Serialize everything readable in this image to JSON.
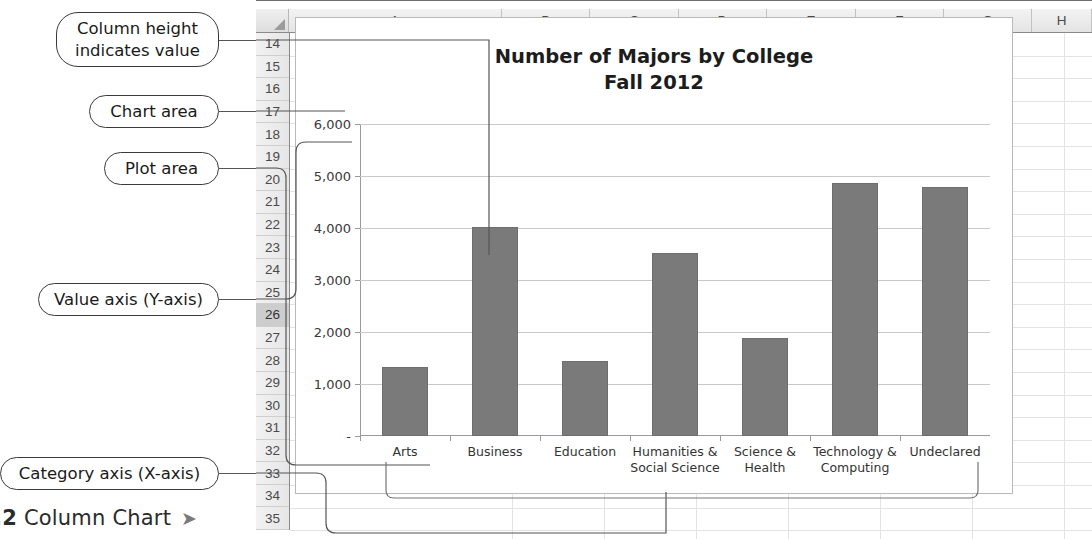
{
  "annotations": {
    "column_height": "Column height\nindicates value",
    "chart_area": "Chart area",
    "plot_area": "Plot area",
    "value_axis": "Value axis (Y-axis)",
    "category_axis": "Category axis (X-axis)"
  },
  "figure_caption": {
    "number": ".2",
    "text": "Column Chart",
    "arrow": "➤"
  },
  "spreadsheet": {
    "columns": [
      "A",
      "B",
      "C",
      "D",
      "E",
      "F",
      "G",
      "H"
    ],
    "rows": [
      "14",
      "15",
      "16",
      "17",
      "18",
      "19",
      "20",
      "21",
      "22",
      "23",
      "24",
      "25",
      "26",
      "27",
      "28",
      "29",
      "30",
      "31",
      "32",
      "33",
      "34",
      "35"
    ],
    "selected_row": "26",
    "corner_icon": "select-all-triangle-icon"
  },
  "chart": {
    "title_line1": "Number of Majors by College",
    "title_line2": "Fall 2012",
    "zero_tick_label": "-",
    "bar_color": "#7a7a7a",
    "gridline_color": "#c9c9c9"
  },
  "chart_data": {
    "type": "bar",
    "title": "Number of Majors by College Fall 2012",
    "xlabel": "",
    "ylabel": "",
    "categories": [
      "Arts",
      "Business",
      "Education",
      "Humanities &\nSocial Science",
      "Science &\nHealth",
      "Technology &\nComputing",
      "Undeclared"
    ],
    "values": [
      1330,
      4020,
      1450,
      3520,
      1880,
      4870,
      4780
    ],
    "ylim": [
      0,
      6000
    ],
    "ytick_values": [
      0,
      1000,
      2000,
      3000,
      4000,
      5000,
      6000
    ],
    "ytick_labels": [
      "-",
      "1,000",
      "2,000",
      "3,000",
      "4,000",
      "5,000",
      "6,000"
    ],
    "grid": true,
    "legend": false
  }
}
